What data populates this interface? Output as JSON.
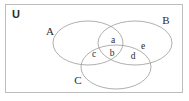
{
  "figure": {
    "background_color": "#ffffff",
    "curve_color": "#9a9a9a",
    "frame_color": "#bdbdbd",
    "text_color": "#2b2b2b"
  },
  "universe": {
    "label": "U",
    "label_x": 16,
    "label_y": 15
  },
  "sets": [
    {
      "id": "A",
      "label": "A",
      "label_x": 50,
      "label_y": 32,
      "cx": 88,
      "cy": 43,
      "rx": 35,
      "ry": 22
    },
    {
      "id": "B",
      "label": "B",
      "label_x": 166,
      "label_y": 21,
      "cx": 135,
      "cy": 43,
      "rx": 37,
      "ry": 22
    },
    {
      "id": "C",
      "label": "C",
      "label_x": 78,
      "label_y": 81,
      "cx": 116,
      "cy": 67,
      "rx": 35,
      "ry": 22
    }
  ],
  "regions": [
    {
      "id": "a",
      "label": "a",
      "label_x": 113,
      "label_y": 41,
      "meaning": "A and B only"
    },
    {
      "id": "b",
      "label": "b",
      "label_x": 112,
      "label_y": 54,
      "meaning": "A and B and C"
    },
    {
      "id": "c",
      "label": "c",
      "label_x": 94,
      "label_y": 55,
      "meaning": "A and C only"
    },
    {
      "id": "d",
      "label": "d",
      "label_x": 133,
      "label_y": 57,
      "meaning": "B and C only"
    },
    {
      "id": "e",
      "label": "e",
      "label_x": 143,
      "label_y": 47,
      "meaning": "B only"
    }
  ]
}
